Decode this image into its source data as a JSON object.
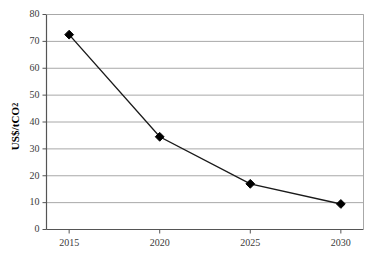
{
  "chart_data": {
    "type": "line",
    "title": "",
    "subtitle": "",
    "xlabel": "",
    "ylabel": "US$/tCO2",
    "ylabel_parts": {
      "main": "US$/tCO",
      "subscript": "2"
    },
    "categories": [
      "2015",
      "2020",
      "2025",
      "2030"
    ],
    "x": [
      2015,
      2020,
      2025,
      2030
    ],
    "values": [
      72.5,
      34.5,
      17.0,
      9.5
    ],
    "series": [
      {
        "name": "Carbon price",
        "values": [
          72.5,
          34.5,
          17.0,
          9.5
        ]
      }
    ],
    "xlim": [
      2013.75,
      2031.25
    ],
    "ylim": [
      0,
      80
    ],
    "yticks": [
      0,
      10,
      20,
      30,
      40,
      50,
      60,
      70,
      80
    ],
    "ytick_labels": [
      "0",
      "10",
      "20",
      "30",
      "40",
      "50",
      "60",
      "70",
      "80"
    ],
    "xticks": [
      2015,
      2020,
      2025,
      2030
    ],
    "xtick_labels": [
      "2015",
      "2020",
      "2025",
      "2030"
    ],
    "grid": "horizontal",
    "legend": "none",
    "marker": "diamond",
    "marker_color": "#000000",
    "line_color": "#1a1a1a",
    "gridline_color": "#a8a8a8",
    "axis_color": "#555555",
    "plot_background": "#ffffff"
  }
}
